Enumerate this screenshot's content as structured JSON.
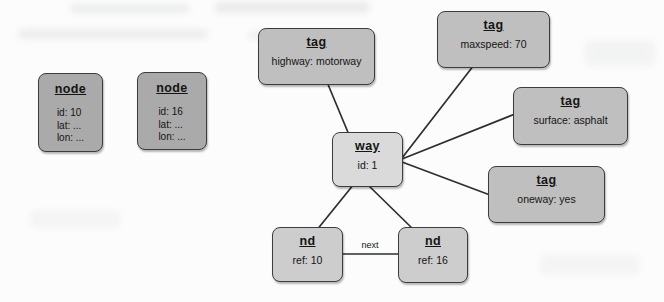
{
  "diagram": {
    "boxes": [
      {
        "key": "node-10",
        "title": "node",
        "body": [
          "id: 10",
          "lat: ...",
          "lon: ..."
        ]
      },
      {
        "key": "node-16",
        "title": "node",
        "body": [
          "id: 16",
          "lat: ...",
          "lon: ..."
        ]
      },
      {
        "key": "tag-highway",
        "title": "tag",
        "body": [
          "highway: motorway"
        ]
      },
      {
        "key": "tag-maxspeed",
        "title": "tag",
        "body": [
          "maxspeed: 70"
        ]
      },
      {
        "key": "tag-surface",
        "title": "tag",
        "body": [
          "surface: asphalt"
        ]
      },
      {
        "key": "tag-oneway",
        "title": "tag",
        "body": [
          "oneway: yes"
        ]
      },
      {
        "key": "way-1",
        "title": "way",
        "body": [
          "id: 1"
        ]
      },
      {
        "key": "nd-10",
        "title": "nd",
        "body": [
          "ref: 10"
        ]
      },
      {
        "key": "nd-16",
        "title": "nd",
        "body": [
          "ref: 16"
        ]
      }
    ],
    "edges": [
      {
        "from": "tag-highway",
        "to": "way-1",
        "label": ""
      },
      {
        "from": "tag-maxspeed",
        "to": "way-1",
        "label": ""
      },
      {
        "from": "tag-surface",
        "to": "way-1",
        "label": ""
      },
      {
        "from": "tag-oneway",
        "to": "way-1",
        "label": ""
      },
      {
        "from": "way-1",
        "to": "nd-10",
        "label": ""
      },
      {
        "from": "way-1",
        "to": "nd-16",
        "label": ""
      },
      {
        "from": "nd-10",
        "to": "nd-16",
        "label": "next"
      }
    ],
    "colors": {
      "node_fill": "#aaaaaa",
      "tag_fill": "#bfbfbf",
      "way_fill": "#dadada",
      "nd_fill": "#cdcdcd",
      "border": "#3c3c3c",
      "edge": "#2e2e2e",
      "text": "#141414",
      "background": "#fcfcfc"
    }
  }
}
